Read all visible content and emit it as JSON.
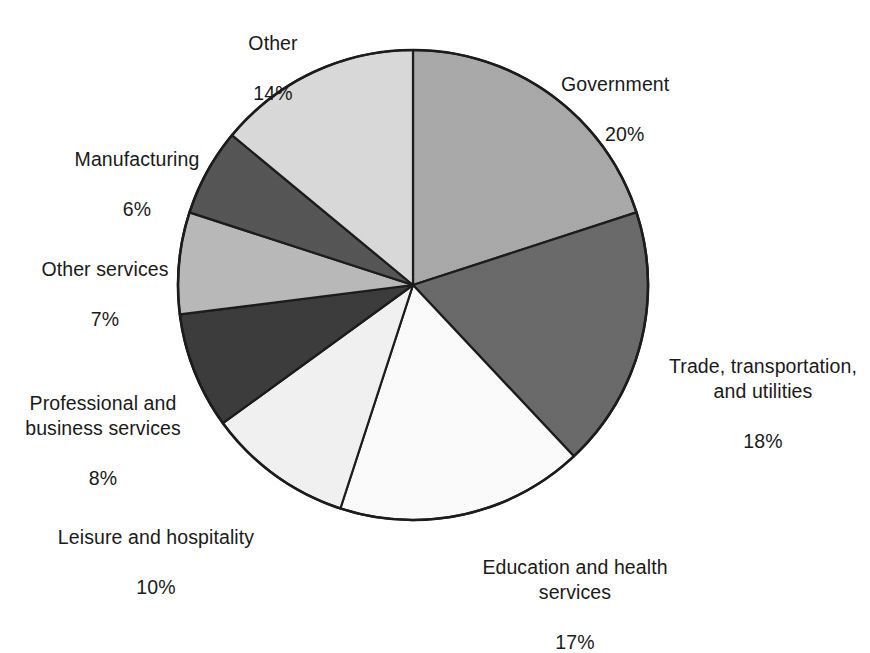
{
  "chart_data": {
    "type": "pie",
    "title": "",
    "subtitle": "",
    "xlabel": "",
    "ylabel": "",
    "legend_position": "none",
    "grid": false,
    "start_angle_deg": 0,
    "direction": "clockwise",
    "units": "percent",
    "total": 100,
    "categories": [
      "Government",
      "Trade, transportation, and utilities",
      "Education and health services",
      "Leisure and hospitality",
      "Professional and business services",
      "Other services",
      "Manufacturing",
      "Other"
    ],
    "values": [
      20,
      18,
      17,
      10,
      8,
      7,
      6,
      14
    ],
    "colors": [
      "#a9a9a9",
      "#6a6a6a",
      "#fbfbfb",
      "#f1f1f1",
      "#3c3c3c",
      "#b9b9b9",
      "#565656",
      "#d9d9d9"
    ],
    "slices": [
      {
        "label": "Government",
        "value": 20,
        "value_text": "20%",
        "color": "#a9a9a9"
      },
      {
        "label": "Trade, transportation,\nand utilities",
        "value": 18,
        "value_text": "18%",
        "color": "#6a6a6a"
      },
      {
        "label": "Education and health\nservices",
        "value": 17,
        "value_text": "17%",
        "color": "#fbfbfb"
      },
      {
        "label": "Leisure and hospitality",
        "value": 10,
        "value_text": "10%",
        "color": "#f1f1f1"
      },
      {
        "label": "Professional and\nbusiness services",
        "value": 8,
        "value_text": "8%",
        "color": "#3c3c3c"
      },
      {
        "label": "Other services",
        "value": 7,
        "value_text": "7%",
        "color": "#b9b9b9"
      },
      {
        "label": "Manufacturing",
        "value": 6,
        "value_text": "6%",
        "color": "#565656"
      },
      {
        "label": "Other",
        "value": 14,
        "value_text": "14%",
        "color": "#d9d9d9"
      }
    ]
  },
  "labels": {
    "other": {
      "name": "Other",
      "pct": "14%"
    },
    "government": {
      "name": "Government",
      "pct": "20%"
    },
    "trade": {
      "name": "Trade, transportation,\nand utilities",
      "pct": "18%"
    },
    "education": {
      "name": "Education and health\nservices",
      "pct": "17%"
    },
    "leisure": {
      "name": "Leisure and hospitality",
      "pct": "10%"
    },
    "professional": {
      "name": "Professional and\nbusiness services",
      "pct": "8%"
    },
    "other_services": {
      "name": "Other services",
      "pct": "7%"
    },
    "manufacturing": {
      "name": "Manufacturing",
      "pct": "6%"
    }
  },
  "style": {
    "outline_color": "#1c1c1c",
    "background": "#ffffff",
    "text_color": "#1a1a1a"
  }
}
